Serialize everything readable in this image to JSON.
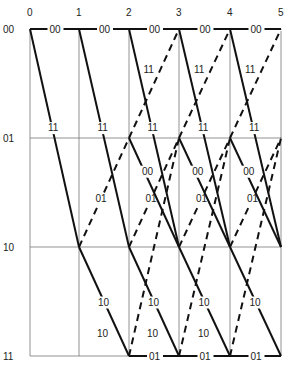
{
  "diagram": {
    "type": "trellis",
    "time_labels": [
      "0",
      "1",
      "2",
      "3",
      "4",
      "5"
    ],
    "state_labels": [
      "00",
      "01",
      "10",
      "11"
    ],
    "column_x": [
      30,
      79,
      129,
      179,
      230,
      281
    ],
    "row_y": [
      29,
      138,
      247,
      356
    ],
    "branch_labels": {
      "s00_to_s00": "00",
      "s00_to_s10": "11",
      "s01_to_s00": "11",
      "s01_to_s10": "00",
      "s10_to_s01": "01",
      "s10_to_s11": "10",
      "s11_to_s01": "10",
      "s11_to_s11": "01"
    },
    "legend": {
      "solid": "input 0",
      "dashed": "input 1"
    }
  }
}
